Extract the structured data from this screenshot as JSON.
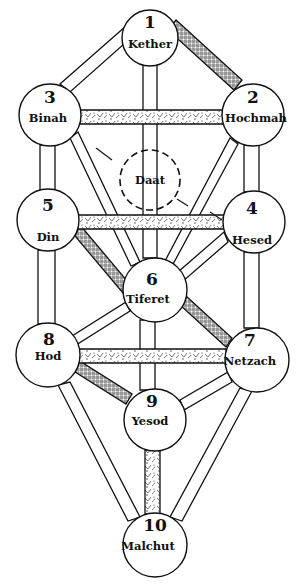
{
  "diagram": {
    "sefirot": [
      {
        "id": "kether",
        "number": "1",
        "label": "Kether",
        "cx": 150,
        "cy": 38,
        "r": 28
      },
      {
        "id": "hochmah",
        "number": "2",
        "label": "Hochmah",
        "cx": 253,
        "cy": 115,
        "r": 31
      },
      {
        "id": "binah",
        "number": "3",
        "label": "Binah",
        "cx": 50,
        "cy": 115,
        "r": 31
      },
      {
        "id": "hesed",
        "number": "4",
        "label": "Hesed",
        "cx": 254,
        "cy": 222,
        "r": 31
      },
      {
        "id": "din",
        "number": "5",
        "label": "Din",
        "cx": 48,
        "cy": 220,
        "r": 31
      },
      {
        "id": "tiferet",
        "number": "6",
        "label": "Tiferet",
        "cx": 155,
        "cy": 290,
        "r": 32
      },
      {
        "id": "netzach",
        "number": "7",
        "label": "Netzach",
        "cx": 257,
        "cy": 360,
        "r": 32
      },
      {
        "id": "hod",
        "number": "8",
        "label": "Hod",
        "cx": 48,
        "cy": 355,
        "r": 32
      },
      {
        "id": "yesod",
        "number": "9",
        "label": "Yesod",
        "cx": 155,
        "cy": 420,
        "r": 31
      },
      {
        "id": "malchut",
        "number": "10",
        "label": "Malchut",
        "cx": 155,
        "cy": 545,
        "r": 32
      }
    ],
    "daat": {
      "label": "Daat",
      "cx": 150,
      "cy": 180,
      "r": 30
    }
  }
}
